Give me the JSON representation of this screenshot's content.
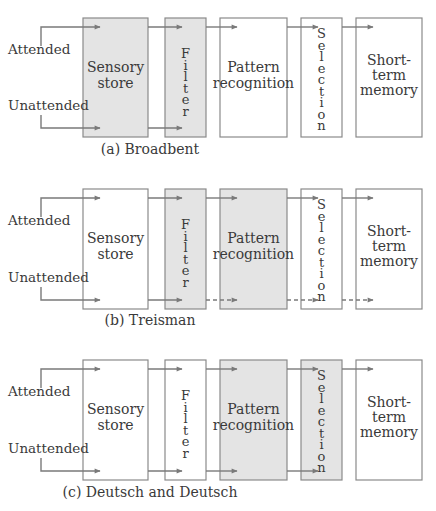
{
  "colors": {
    "stroke": "#8a8a8a",
    "arrow": "#7a7a7a",
    "shaded_fill": "#e4e4e4",
    "plain_fill": "#ffffff",
    "text": "#3a3a3a"
  },
  "inputs": {
    "attended": "Attended",
    "unattended": "Unattended"
  },
  "stages": {
    "sensory": [
      "Sensory",
      "store"
    ],
    "filter": "Filter",
    "pattern": [
      "Pattern",
      "recognition"
    ],
    "selection": "Selection",
    "stm": [
      "Short-",
      "term",
      "memory"
    ]
  },
  "panels": [
    {
      "caption": "(a) Broadbent",
      "shaded": [
        "sensory",
        "filter"
      ],
      "unattended_dashed_after_filter": false,
      "unattended_stops_at": "filter"
    },
    {
      "caption": "(b) Treisman",
      "shaded": [
        "filter",
        "pattern"
      ],
      "unattended_dashed_after_filter": true,
      "unattended_stops_at": "stm"
    },
    {
      "caption": "(c) Deutsch and Deutsch",
      "shaded": [
        "pattern",
        "selection"
      ],
      "unattended_dashed_after_filter": false,
      "unattended_stops_at": "selection"
    }
  ]
}
